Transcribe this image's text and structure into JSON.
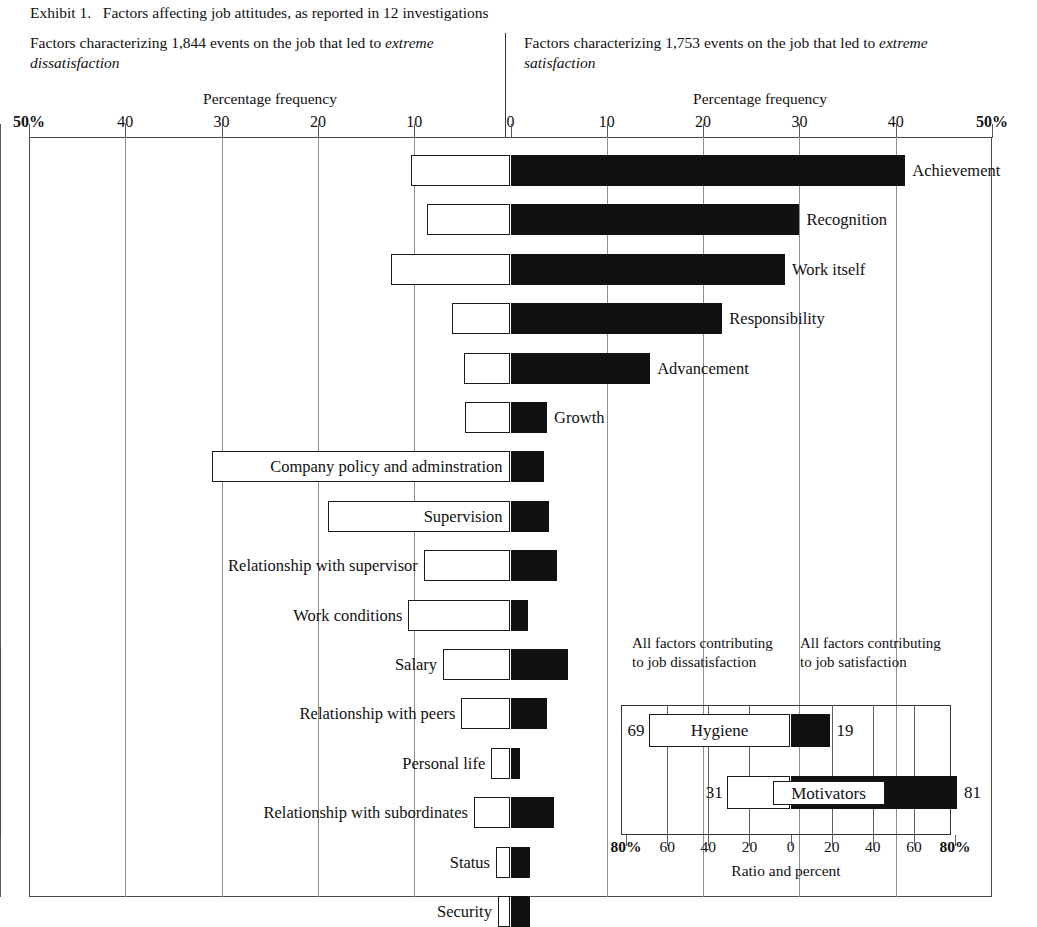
{
  "exhibit": {
    "title": "Exhibit 1.   Factors affecting job attitudes, as reported in 12 investigations"
  },
  "columns": {
    "left": {
      "heading": "Factors characterizing 1,844 events on the job that led to",
      "heading_emphasis": "extreme dissatisfaction",
      "axis_title": "Percentage frequency"
    },
    "right": {
      "heading": "Factors characterizing 1,753 events on the job that led to",
      "heading_emphasis": "extreme satisfaction",
      "axis_title": "Percentage frequency"
    }
  },
  "axis": {
    "ticks": [
      "50%",
      "40",
      "30",
      "20",
      "10",
      "0",
      "10",
      "20",
      "30",
      "40",
      "50%"
    ],
    "tick_values": [
      -50,
      -40,
      -30,
      -20,
      -10,
      0,
      10,
      20,
      30,
      40,
      50
    ],
    "bold_ticks": [
      0,
      10
    ]
  },
  "chart_data": {
    "type": "bar",
    "orientation": "horizontal-bidirectional",
    "title": "Factors affecting job attitudes, as reported in 12 investigations",
    "xlabel": "Percentage frequency",
    "ylabel": "",
    "xlim": [
      -50,
      50
    ],
    "grid": true,
    "legend": [
      "extreme dissatisfaction (white, left)",
      "extreme satisfaction (black, right)"
    ],
    "left_series_name": "Percentage frequency of extreme dissatisfaction",
    "right_series_name": "Percentage frequency of extreme satisfaction",
    "categories": [
      "Achievement",
      "Recognition",
      "Work itself",
      "Responsibility",
      "Advancement",
      "Growth",
      "Company policy and adminstration",
      "Supervision",
      "Relationship with supervisor",
      "Work conditions",
      "Salary",
      "Relationship with peers",
      "Personal life",
      "Relationship with subordinates",
      "Status",
      "Security"
    ],
    "dissatisfaction": [
      10.3,
      8.7,
      12.4,
      6.1,
      4.8,
      4.7,
      31.0,
      19.0,
      9.0,
      10.6,
      7.0,
      5.1,
      2.0,
      3.8,
      1.5,
      1.3
    ],
    "satisfaction": [
      41.0,
      30.0,
      28.5,
      22.0,
      14.5,
      3.8,
      3.5,
      4.0,
      4.8,
      1.8,
      6.0,
      3.8,
      1.0,
      4.5,
      2.0,
      2.0
    ],
    "rows": [
      {
        "label": "Achievement",
        "neg": 10.3,
        "pos": 41.0,
        "label_side": "right"
      },
      {
        "label": "Recognition",
        "neg": 8.7,
        "pos": 30.0,
        "label_side": "right"
      },
      {
        "label": "Work itself",
        "neg": 12.4,
        "pos": 28.5,
        "label_side": "right"
      },
      {
        "label": "Responsibility",
        "neg": 6.1,
        "pos": 22.0,
        "label_side": "right"
      },
      {
        "label": "Advancement",
        "neg": 4.8,
        "pos": 14.5,
        "label_side": "right"
      },
      {
        "label": "Growth",
        "neg": 4.7,
        "pos": 3.8,
        "label_side": "right"
      },
      {
        "label": "Company policy and adminstration",
        "neg": 31.0,
        "pos": 3.5,
        "label_side": "inside-left"
      },
      {
        "label": "Supervision",
        "neg": 19.0,
        "pos": 4.0,
        "label_side": "inside-left"
      },
      {
        "label": "Relationship with supervisor",
        "neg": 9.0,
        "pos": 4.8,
        "label_side": "left"
      },
      {
        "label": "Work conditions",
        "neg": 10.6,
        "pos": 1.8,
        "label_side": "left"
      },
      {
        "label": "Salary",
        "neg": 7.0,
        "pos": 6.0,
        "label_side": "left"
      },
      {
        "label": "Relationship with peers",
        "neg": 5.1,
        "pos": 3.8,
        "label_side": "left"
      },
      {
        "label": "Personal life",
        "neg": 2.0,
        "pos": 1.0,
        "label_side": "left"
      },
      {
        "label": "Relationship with subordinates",
        "neg": 3.8,
        "pos": 4.5,
        "label_side": "left"
      },
      {
        "label": "Status",
        "neg": 1.5,
        "pos": 2.0,
        "label_side": "left"
      },
      {
        "label": "Security",
        "neg": 1.3,
        "pos": 2.0,
        "label_side": "left"
      }
    ]
  },
  "inset": {
    "heading_left": "All factors\ncontributing to\njob dissatisfaction",
    "heading_right": "All factors\ncontributing to\njob satisfaction",
    "axis_label": "Ratio and percent",
    "ticks": [
      "80%",
      "60",
      "40",
      "20",
      "0",
      "20",
      "40",
      "60",
      "80%"
    ],
    "tick_values": [
      -80,
      -60,
      -40,
      -20,
      0,
      20,
      40,
      60,
      80
    ],
    "bold_ticks": [
      0,
      8
    ],
    "chart_data": {
      "type": "bar",
      "orientation": "horizontal-bidirectional",
      "xlabel": "Ratio and percent",
      "xlim": [
        -80,
        80
      ],
      "grid": true,
      "categories": [
        "Hygiene",
        "Motivators"
      ],
      "dissatisfaction": [
        69,
        31
      ],
      "satisfaction": [
        19,
        81
      ],
      "rows": [
        {
          "label": "Hygiene",
          "neg": 69,
          "pos": 19,
          "neg_value": "69",
          "pos_value": "19",
          "label_boxed": true
        },
        {
          "label": "Motivators",
          "neg": 31,
          "pos": 81,
          "neg_value": "31",
          "pos_value": "81",
          "label_boxed": true
        }
      ]
    }
  }
}
